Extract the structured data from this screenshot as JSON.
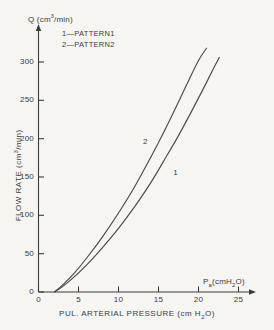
{
  "figure": {
    "background_color": "#f6f5f1",
    "ink_color": "#3c3c3c"
  },
  "axes": {
    "y_axis_symbol_prefix": "Q (cm",
    "y_axis_symbol_exponent": "3",
    "y_axis_symbol_suffix": "/min)",
    "y_axis_name_prefix": "FLOW RATE (cm",
    "y_axis_name_exponent": "3",
    "y_axis_name_suffix": "/min)",
    "x_axis_symbol_prefix": "P",
    "x_axis_symbol_sub": "a",
    "x_axis_symbol_suffix_a": "(cmH",
    "x_axis_symbol_sub2": "2",
    "x_axis_symbol_suffix_b": "O)",
    "x_axis_name_prefix": "PUL. ARTERIAL PRESSURE (cm H",
    "x_axis_name_sub": "2",
    "x_axis_name_suffix": "O)"
  },
  "legend": {
    "entries": [
      {
        "label": "1—PATTERN1"
      },
      {
        "label": "2—PATTERN2"
      }
    ]
  },
  "curve_tags": [
    {
      "label": "2"
    },
    {
      "label": "1"
    }
  ],
  "chart_data": {
    "type": "line",
    "title": "",
    "xlabel": "PUL. ARTERIAL PRESSURE (cm H2O)",
    "ylabel": "FLOW RATE (cm3/min)",
    "xlim": [
      0,
      26
    ],
    "ylim": [
      0,
      330
    ],
    "xticks": [
      0,
      5,
      10,
      15,
      20,
      25
    ],
    "yticks": [
      0,
      50,
      100,
      150,
      200,
      250,
      300
    ],
    "xtick_labels": [
      "0",
      "5",
      "10",
      "15",
      "20",
      "25"
    ],
    "ytick_labels": [
      "0",
      "50",
      "100",
      "150",
      "200",
      "250",
      "300"
    ],
    "grid": false,
    "legend_position": "upper-left",
    "annotations": [
      "1—PATTERN1",
      "2—PATTERN2"
    ],
    "series": [
      {
        "name": "PATTERN2",
        "tag": "2",
        "x": [
          2.0,
          3.0,
          4.5,
          6.0,
          8.0,
          10.0,
          12.0,
          14.0,
          15.5,
          17.0,
          18.5,
          20.0,
          21.0
        ],
        "y": [
          0,
          9,
          25,
          44,
          72,
          103,
          137,
          175,
          205,
          237,
          270,
          302,
          318
        ]
      },
      {
        "name": "PATTERN1",
        "tag": "1",
        "x": [
          2.0,
          3.0,
          4.5,
          6.0,
          8.0,
          10.0,
          12.0,
          14.0,
          16.0,
          17.5,
          19.0,
          20.5,
          22.0,
          22.6
        ],
        "y": [
          0,
          7,
          20,
          35,
          58,
          83,
          111,
          142,
          177,
          204,
          233,
          263,
          294,
          306
        ]
      }
    ]
  }
}
